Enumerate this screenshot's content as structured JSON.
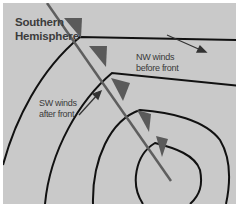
{
  "diagram": {
    "title_line1": "Southern",
    "title_line2": "Hemisphere",
    "labels": {
      "nw_line1": "NW winds",
      "nw_line2": "before front",
      "sw_line1": "SW winds",
      "sw_line2": "after front"
    },
    "colors": {
      "background": "#c9c9c9",
      "isobar": "#111111",
      "front": "#5a5a5a",
      "text": "#3a3a3a"
    },
    "elements": [
      "isobars",
      "cold-front",
      "front-triangles",
      "wind-arrows"
    ]
  }
}
